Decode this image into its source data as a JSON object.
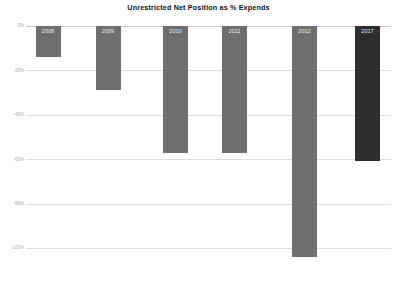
{
  "chart_data": {
    "type": "bar",
    "title": "Unrestricted Net Position as % Expends",
    "xlabel": "",
    "ylabel": "",
    "categories": [
      "2008",
      "2009",
      "2010",
      "2011",
      "2012",
      "2017"
    ],
    "values": [
      -14,
      -29,
      -57,
      -57,
      -104,
      -61
    ],
    "ylim": [
      -100,
      0
    ],
    "ytick_labels": [
      "0%",
      "-20%",
      "-40%",
      "-60%",
      "-80%",
      "-100%"
    ],
    "ytick_values": [
      0,
      -20,
      -40,
      -60,
      -80,
      -100
    ],
    "grid": true,
    "legend": "none",
    "series": [
      {
        "name": "Unrestricted Net Position as % Expends",
        "values": [
          -14,
          -29,
          -57,
          -57,
          -104,
          -61
        ]
      }
    ],
    "bar_colors": [
      "#6e6e6e",
      "#6e6e6e",
      "#6e6e6e",
      "#6e6e6e",
      "#6e6e6e",
      "#2e2e2e"
    ],
    "data_labels": [
      "2008",
      "2009",
      "2010",
      "2011",
      "2012",
      "2017"
    ],
    "data_label_color": "#f2f2f2",
    "gridline_color": "#dcdcdc",
    "title_color": "#0f0f0f",
    "tick_label_color": "#a8a8a8",
    "background": "#ffffff"
  }
}
